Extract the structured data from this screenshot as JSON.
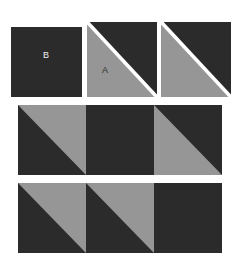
{
  "figure": {
    "name": "triangle-tiling-figure",
    "background": "#ffffff",
    "width": 240,
    "height": 270
  },
  "colors": {
    "dark": "#2b2b2b",
    "gray": "#969696",
    "background": "#ffffff",
    "label_on_dark": "#f0f0f0",
    "label_on_gray": "#2b2b2b"
  },
  "legend_row": {
    "name": "key-shapes-row",
    "pieces": [
      {
        "id": "piece-b",
        "label": "B",
        "label_color": "#f0f0f0",
        "kind": "square",
        "fill": "dark",
        "x": 11,
        "y": 27,
        "w": 71,
        "h": 70,
        "label_x": 46,
        "label_y": 58
      },
      {
        "id": "piece-a",
        "label": "A",
        "label_color": "#2b2b2b",
        "kind": "split-square",
        "diagonal": "tl-br",
        "lower_left_fill": "gray",
        "upper_right_fill": "dark",
        "x": 87,
        "y": 22,
        "w": 70,
        "h": 75,
        "label_x": 105,
        "label_y": 73
      },
      {
        "id": "piece-a-copy",
        "label": "",
        "label_color": "#2b2b2b",
        "kind": "split-square",
        "diagonal": "tl-br",
        "lower_left_fill": "gray",
        "upper_right_fill": "dark",
        "x": 161,
        "y": 22,
        "w": 70,
        "h": 75,
        "label_x": 0,
        "label_y": 0
      }
    ]
  },
  "assembly_rows": [
    {
      "id": "middle-row",
      "name": "assembled-strip-middle",
      "x": 18,
      "y": 105,
      "w": 204,
      "h": 70,
      "cells": [
        {
          "id": "middle-cell-1",
          "pattern": "gray-upper-right",
          "label": ""
        },
        {
          "id": "middle-cell-2",
          "pattern": "solid-dark",
          "label": ""
        },
        {
          "id": "middle-cell-3",
          "pattern": "gray-lower-left",
          "label": ""
        }
      ]
    },
    {
      "id": "bottom-row",
      "name": "assembled-strip-bottom",
      "x": 18,
      "y": 183,
      "w": 204,
      "h": 70,
      "cells": [
        {
          "id": "bottom-cell-1",
          "pattern": "gray-upper-right",
          "label": ""
        },
        {
          "id": "bottom-cell-2",
          "pattern": "gray-upper-right",
          "label": ""
        },
        {
          "id": "bottom-cell-3",
          "pattern": "solid-dark",
          "label": ""
        }
      ]
    }
  ]
}
